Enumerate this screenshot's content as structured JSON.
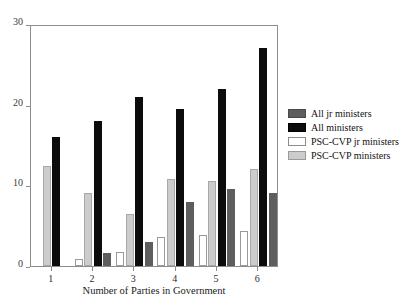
{
  "chart_data": {
    "type": "bar",
    "title": "",
    "xlabel": "Number of Parties in Government",
    "ylabel": "",
    "categories": [
      "1",
      "2",
      "3",
      "4",
      "5",
      "6"
    ],
    "ylim": [
      0,
      30
    ],
    "yticks": [
      0,
      10,
      20,
      30
    ],
    "ytick_labels": [
      "0",
      "10",
      "20",
      "30"
    ],
    "grid": false,
    "legend_position": "right",
    "series": [
      {
        "name": "PSC-CVP jr ministers",
        "color": "#ffffff",
        "values": [
          0,
          0.9,
          1.7,
          3.6,
          3.9,
          4.4
        ]
      },
      {
        "name": "PSC-CVP ministers",
        "color": "#cccccc",
        "values": [
          12.4,
          9.0,
          6.4,
          10.8,
          10.6,
          12.0
        ]
      },
      {
        "name": "All ministers",
        "color": "#0c0c0c",
        "values": [
          16.0,
          18.0,
          21.0,
          19.5,
          22.0,
          27.0
        ]
      },
      {
        "name": "All jr ministers",
        "color": "#5e5e5e",
        "values": [
          0,
          1.6,
          3.0,
          7.9,
          9.6,
          9.1
        ]
      }
    ]
  },
  "axes": {
    "y_ticks": [
      {
        "label": "30",
        "value": 30
      },
      {
        "label": "20",
        "value": 20
      },
      {
        "label": "10",
        "value": 10
      },
      {
        "label": "0",
        "value": 0
      }
    ],
    "x_ticks": [
      {
        "label": "1"
      },
      {
        "label": "2"
      },
      {
        "label": "3"
      },
      {
        "label": "4"
      },
      {
        "label": "5"
      },
      {
        "label": "6"
      }
    ],
    "x_title": "Number of Parties in Government"
  },
  "legend": {
    "items": [
      {
        "label": "All jr ministers",
        "swatch": "all-jr",
        "color": "#5e5e5e"
      },
      {
        "label": "All ministers",
        "swatch": "all-min",
        "color": "#0c0c0c"
      },
      {
        "label": "PSC-CVP jr ministers",
        "swatch": "psc-jr",
        "color": "#ffffff"
      },
      {
        "label": "PSC-CVP ministers",
        "swatch": "psc-min",
        "color": "#cccccc"
      }
    ]
  }
}
